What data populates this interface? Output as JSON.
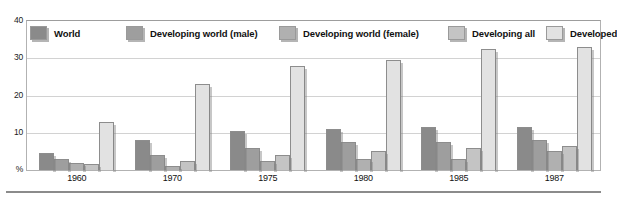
{
  "chart_data": {
    "type": "bar",
    "title": "",
    "xlabel": "",
    "ylabel": "%",
    "ylim": [
      0,
      40
    ],
    "yticks": [
      "%",
      "10",
      "20",
      "30",
      "40"
    ],
    "ytick_values": [
      0,
      10,
      20,
      30,
      40
    ],
    "grid": true,
    "legend_position": "top",
    "categories": [
      "1960",
      "1970",
      "1975",
      "1980",
      "1985",
      "1987"
    ],
    "series": [
      {
        "name": "World",
        "color": "#8a8a8a",
        "values": [
          4.5,
          8.0,
          10.5,
          11.0,
          11.5,
          11.5
        ]
      },
      {
        "name": "Developing world (male)",
        "color": "#9e9e9e",
        "values": [
          3.0,
          4.0,
          6.0,
          7.5,
          7.5,
          8.0
        ]
      },
      {
        "name": "Developing world (female)",
        "color": "#b0b0b0",
        "values": [
          2.0,
          1.0,
          2.5,
          3.0,
          3.0,
          5.0
        ]
      },
      {
        "name": "Developing all",
        "color": "#c4c4c4",
        "values": [
          1.5,
          2.5,
          4.0,
          5.0,
          6.0,
          6.5
        ]
      },
      {
        "name": "Developed",
        "color": "#e2e2e2",
        "values": [
          13.0,
          23.0,
          28.0,
          29.5,
          32.5,
          33.0
        ]
      }
    ]
  },
  "axis": {
    "y_top_label": "40",
    "y_labels": [
      "40",
      "30",
      "20",
      "10",
      "%"
    ]
  },
  "legend": {
    "items": [
      {
        "label": "World",
        "color": "#8a8a8a"
      },
      {
        "label": "Developing world (male)",
        "color": "#9e9e9e"
      },
      {
        "label": "Developing world (female)",
        "color": "#b0b0b0"
      },
      {
        "label": "Developing all",
        "color": "#c4c4c4"
      },
      {
        "label": "Developed",
        "color": "#e2e2e2"
      }
    ]
  }
}
